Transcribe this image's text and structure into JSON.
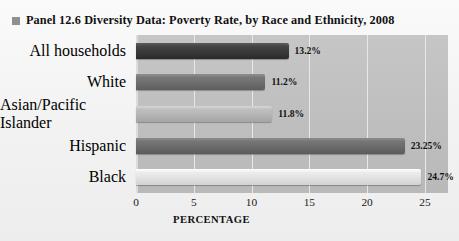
{
  "title": {
    "bullet": "square-bullet",
    "text": "Panel 12.6  Diversity Data: Poverty Rate, by Race and Ethnicity, 2008"
  },
  "chart_data": {
    "type": "bar",
    "orientation": "horizontal",
    "title": "Panel 12.6  Diversity Data: Poverty Rate, by Race and Ethnicity, 2008",
    "xlabel": "PERCENTAGE",
    "ylabel": "",
    "xlim": [
      0,
      27
    ],
    "xticks": [
      "0",
      "5",
      "10",
      "15",
      "20",
      "25"
    ],
    "xtick_values": [
      0,
      5,
      10,
      15,
      20,
      25
    ],
    "grid": true,
    "legend": "none",
    "categories": [
      "All households",
      "White",
      "Asian/Pacific Islander",
      "Hispanic",
      "Black"
    ],
    "values": [
      13.2,
      11.2,
      11.8,
      23.25,
      24.7
    ],
    "data_labels": [
      "13.2%",
      "11.2%",
      "11.8%",
      "23.25%",
      "24.7%"
    ],
    "bar_colors": [
      "#3a3a3a",
      "#6e6e6e",
      "#b5b5b5",
      "#6b6b6b",
      "#e2e2e2"
    ]
  },
  "axis": {
    "ticks": [
      "0",
      "5",
      "10",
      "15",
      "20",
      "25"
    ],
    "title": "PERCENTAGE"
  },
  "colors": {
    "plot_background": "#c0c0c0",
    "page_background": "#f2f2f2",
    "gridline": "#e8e8e8",
    "text": "#111111"
  }
}
